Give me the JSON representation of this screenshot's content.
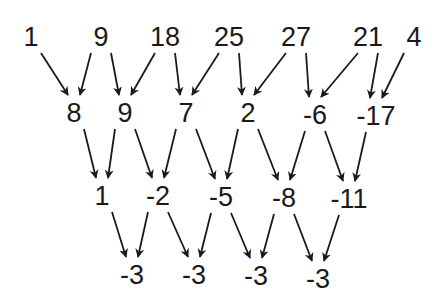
{
  "diagram": {
    "title": "",
    "type": "difference-table",
    "rows": [
      {
        "level": 0,
        "nodes": [
          {
            "label": "1",
            "x": 31,
            "y": 37
          },
          {
            "label": "9",
            "x": 101,
            "y": 37
          },
          {
            "label": "18",
            "x": 165,
            "y": 37
          },
          {
            "label": "25",
            "x": 229,
            "y": 37
          },
          {
            "label": "27",
            "x": 296,
            "y": 37
          },
          {
            "label": "21",
            "x": 368,
            "y": 37
          },
          {
            "label": "4",
            "x": 414,
            "y": 37
          }
        ]
      },
      {
        "level": 1,
        "nodes": [
          {
            "label": "8",
            "x": 74,
            "y": 113
          },
          {
            "label": "9",
            "x": 125,
            "y": 113
          },
          {
            "label": "7",
            "x": 186,
            "y": 113
          },
          {
            "label": "2",
            "x": 248,
            "y": 113
          },
          {
            "label": "-6",
            "x": 315,
            "y": 115
          },
          {
            "label": "-17",
            "x": 376,
            "y": 116
          }
        ]
      },
      {
        "level": 2,
        "nodes": [
          {
            "label": "1",
            "x": 102,
            "y": 196
          },
          {
            "label": "-2",
            "x": 158,
            "y": 196
          },
          {
            "label": "-5",
            "x": 221,
            "y": 197
          },
          {
            "label": "-8",
            "x": 284,
            "y": 198
          },
          {
            "label": "-11",
            "x": 349,
            "y": 199
          }
        ]
      },
      {
        "level": 3,
        "nodes": [
          {
            "label": "-3",
            "x": 132,
            "y": 275
          },
          {
            "label": "-3",
            "x": 194,
            "y": 275
          },
          {
            "label": "-3",
            "x": 256,
            "y": 276
          },
          {
            "label": "-3",
            "x": 318,
            "y": 279
          }
        ]
      }
    ],
    "arrow_color": "#1a1a1a",
    "text_color": "#1a1a1a"
  }
}
